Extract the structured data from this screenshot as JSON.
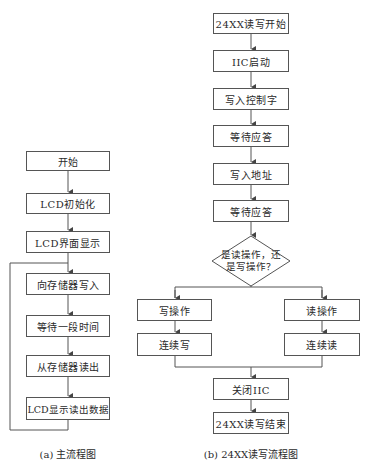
{
  "main_flow": {
    "caption": "(a) 主流程图",
    "steps": [
      {
        "label": "开始",
        "x": 26,
        "y": 151,
        "w": 84,
        "h": 20
      },
      {
        "label": "LCD初始化",
        "x": 26,
        "y": 193,
        "w": 84,
        "h": 21
      },
      {
        "label": "LCD界面显示",
        "x": 26,
        "y": 231,
        "w": 84,
        "h": 22
      },
      {
        "label": "向存储器写入",
        "x": 26,
        "y": 273,
        "w": 84,
        "h": 22
      },
      {
        "label": "等待一段时间",
        "x": 26,
        "y": 315,
        "w": 84,
        "h": 22
      },
      {
        "label": "从存储器读出",
        "x": 26,
        "y": 355,
        "w": 84,
        "h": 22
      },
      {
        "label": "LCD显示读出数据",
        "x": 26,
        "y": 397,
        "w": 84,
        "h": 23
      }
    ]
  },
  "rw_flow": {
    "caption": "(b) 24XX读写流程图",
    "steps": [
      {
        "label": "24XX读写开始",
        "x": 213,
        "y": 13,
        "w": 76,
        "h": 21
      },
      {
        "label": "IIC启动",
        "x": 213,
        "y": 50,
        "w": 76,
        "h": 22
      },
      {
        "label": "写入控制字",
        "x": 213,
        "y": 88,
        "w": 76,
        "h": 22
      },
      {
        "label": "等待应答",
        "x": 213,
        "y": 125,
        "w": 76,
        "h": 22
      },
      {
        "label": "写入地址",
        "x": 213,
        "y": 163,
        "w": 76,
        "h": 22
      },
      {
        "label": "等待应答",
        "x": 213,
        "y": 200,
        "w": 76,
        "h": 22
      }
    ],
    "decision": {
      "line1": "是读操作，还",
      "line2": "是写操作？"
    },
    "write_branch": [
      {
        "label": "写操作",
        "x": 137,
        "y": 299,
        "w": 75,
        "h": 22
      },
      {
        "label": "连续写",
        "x": 137,
        "y": 333,
        "w": 75,
        "h": 23
      }
    ],
    "read_branch": [
      {
        "label": "读操作",
        "x": 284,
        "y": 299,
        "w": 76,
        "h": 22
      },
      {
        "label": "连续读",
        "x": 284,
        "y": 333,
        "w": 76,
        "h": 23
      }
    ],
    "end_steps": [
      {
        "label": "关闭IIC",
        "x": 213,
        "y": 378,
        "w": 76,
        "h": 22
      },
      {
        "label": "24XX读写结束",
        "x": 213,
        "y": 412,
        "w": 76,
        "h": 22
      }
    ]
  }
}
